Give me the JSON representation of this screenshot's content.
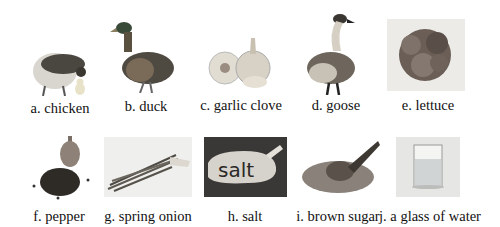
{
  "items": [
    {
      "label": "a. chicken",
      "icon": "chicken-icon"
    },
    {
      "label": "b. duck",
      "icon": "duck-icon"
    },
    {
      "label": "c. garlic clove",
      "icon": "garlic-icon"
    },
    {
      "label": "d. goose",
      "icon": "goose-icon"
    },
    {
      "label": "e. lettuce",
      "icon": "lettuce-icon"
    },
    {
      "label": "f. pepper",
      "icon": "pepper-icon"
    },
    {
      "label": "g. spring onion",
      "icon": "spring-onion-icon"
    },
    {
      "label": "h. salt",
      "icon": "salt-icon"
    },
    {
      "label": "i. brown sugar",
      "icon": "brown-sugar-icon"
    },
    {
      "label": "j. a glass of water",
      "icon": "glass-of-water-icon"
    }
  ],
  "salt_sign_text": "salt"
}
